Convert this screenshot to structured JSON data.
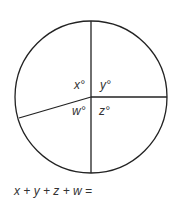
{
  "diagram": {
    "labels": {
      "x": "x°",
      "y": "y°",
      "z": "z°",
      "w": "w°"
    },
    "equation": "x + y + z + w ="
  }
}
